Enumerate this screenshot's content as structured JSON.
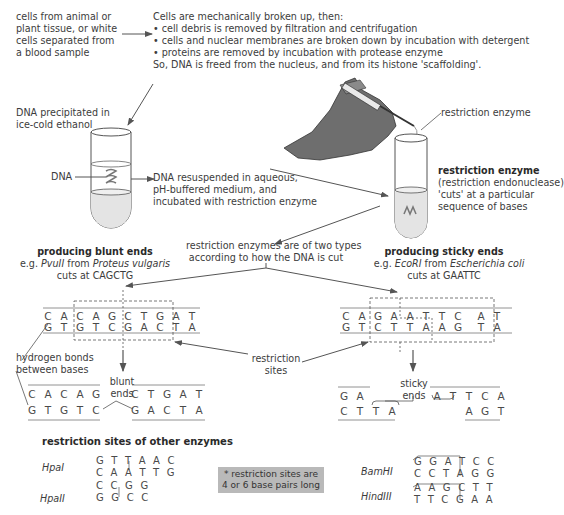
{
  "source": {
    "lines": [
      "cells from animal or",
      "plant tissue, or white",
      "cells separated from",
      "a blood sample"
    ]
  },
  "extraction": {
    "intro": "Cells are mechanically broken up, then:",
    "bullets": [
      "• cell debris is removed by filtration and centrifugation",
      "• cells and nuclear membranes are broken down by incubation with detergent",
      "• proteins are removed by incubation with protease enzyme"
    ],
    "conclusion": "So, DNA is freed from the nucleus, and from its histone 'scaffolding'."
  },
  "precipitation": {
    "lines": [
      "DNA precipitated in",
      "ice-cold ethanol"
    ],
    "dna_label": "DNA"
  },
  "resuspension": {
    "lines": [
      "DNA resuspended in aqueous,",
      "pH-buffered medium, and",
      "incubated with restriction enzyme"
    ]
  },
  "enzyme_tube": {
    "pointer_label": "restriction enzyme",
    "title": "restriction enzyme",
    "lines": [
      "(restriction endonuclease)",
      "'cuts' at a particular",
      "sequence of bases"
    ]
  },
  "types": {
    "lines": [
      "restriction enzymes are of two types",
      "according to how the DNA is cut"
    ]
  },
  "blunt": {
    "title": "producing blunt ends",
    "example_prefix": "e.g. ",
    "enzyme": "PvuII",
    "from": " from ",
    "organism": "Proteus vulgaris",
    "cuts": "cuts at CAGCTG",
    "top_strand": [
      "C",
      "A",
      "C",
      "A",
      "G",
      "C",
      "T",
      "G",
      "A",
      "T"
    ],
    "bottom_strand": [
      "G",
      "T",
      "G",
      "T",
      "C",
      "G",
      "A",
      "C",
      "T",
      "A"
    ],
    "hbond_label": [
      "hydrogen bonds",
      "between bases"
    ],
    "ends_label": [
      "blunt",
      "ends"
    ],
    "left_fragment_top": [
      "C",
      "A",
      "C",
      "A",
      "G"
    ],
    "left_fragment_bottom": [
      "G",
      "T",
      "G",
      "T",
      "C"
    ],
    "right_fragment_top": [
      "C",
      "T",
      "G",
      "A",
      "T"
    ],
    "right_fragment_bottom": [
      "G",
      "A",
      "C",
      "T",
      "A"
    ]
  },
  "sticky": {
    "title": "producing sticky ends",
    "example_prefix": "e.g. ",
    "enzyme": "EcoRI",
    "from": " from ",
    "organism": "Escherichia coli",
    "cuts": "cuts at GAATTC",
    "top_strand": [
      "C",
      "A",
      "G",
      "A",
      "A",
      "T",
      "T",
      "C",
      "A",
      "T"
    ],
    "bottom_strand": [
      "G",
      "T",
      "C",
      "T",
      "T",
      "A",
      "A",
      "G",
      "T",
      "A"
    ],
    "ends_label": [
      "sticky",
      "ends"
    ],
    "left_fragment_top": [
      "G",
      "A"
    ],
    "left_fragment_bottom": [
      "C",
      "T",
      "T",
      "A"
    ],
    "right_fragment_top": [
      "A",
      "T",
      "T",
      "C",
      "A"
    ],
    "right_fragment_bottom": [
      "A",
      "G",
      "T"
    ]
  },
  "restriction_sites_label": [
    "restriction",
    "sites"
  ],
  "other_enzymes": {
    "title": "restriction sites of other enzymes",
    "note": [
      "* restriction sites are",
      "4 or 6 base pairs long"
    ],
    "left": [
      {
        "name": "HpaI",
        "top": "G T T A A C",
        "bottom": "C A A T T G"
      },
      {
        "name": "HpaII",
        "top": "C C G G",
        "bottom": "G G C C"
      }
    ],
    "right": [
      {
        "name": "BamHI",
        "top": "G G A T C C",
        "bottom": "C C T A G G"
      },
      {
        "name": "HindIII",
        "top": "A A G C T T",
        "bottom": "T T C G A A"
      }
    ]
  },
  "colors": {
    "text": "#3c3c3c",
    "arrow": "#555555",
    "glove": "#6e6e6e",
    "note_bg": "#b9b9b9",
    "liquid": "#e4e4e4"
  }
}
